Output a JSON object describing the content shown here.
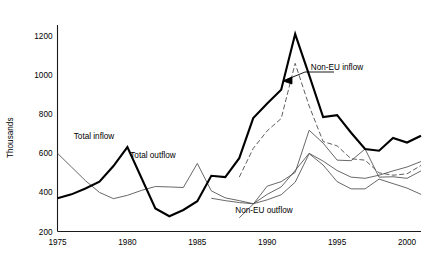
{
  "chart_data": {
    "type": "line",
    "title": "",
    "subtitle": "",
    "xlabel": "",
    "ylabel": "Thousands",
    "xlim": [
      1975,
      2001
    ],
    "ylim": [
      200,
      1200
    ],
    "ytick_labels": [
      "200",
      "400",
      "600",
      "800",
      "1000",
      "1200"
    ],
    "yticks": [
      200,
      400,
      600,
      800,
      1000,
      1200
    ],
    "xtick_labels": [
      "1975",
      "1980",
      "1985",
      "1990",
      "1995",
      "2000"
    ],
    "xticks": [
      1975,
      1980,
      1985,
      1990,
      1995,
      2000
    ],
    "grid": false,
    "legend": "inline-labels",
    "series": [
      {
        "name": "Total inflow",
        "style": "thick-solid",
        "x": [
          1975,
          1976,
          1977,
          1978,
          1979,
          1980,
          1981,
          1982,
          1983,
          1984,
          1985,
          1986,
          1987,
          1988,
          1989,
          1990,
          1991,
          1992,
          1993,
          1994,
          1995,
          1996,
          1997,
          1998,
          1999,
          2000,
          2001
        ],
        "values": [
          370,
          390,
          420,
          455,
          535,
          632,
          475,
          318,
          278,
          310,
          355,
          485,
          478,
          575,
          780,
          855,
          925,
          1210,
          1000,
          785,
          795,
          705,
          622,
          613,
          678,
          655,
          690
        ]
      },
      {
        "name": "Total outflow",
        "style": "thin-solid",
        "x": [
          1975,
          1976,
          1977,
          1978,
          1979,
          1980,
          1981,
          1982,
          1983,
          1984,
          1985,
          1986,
          1987,
          1988,
          1989,
          1990,
          1991,
          1992,
          1993,
          1994,
          1995,
          1996,
          1997,
          1998,
          1999,
          2000,
          2001
        ],
        "values": [
          600,
          530,
          460,
          400,
          368,
          385,
          410,
          430,
          428,
          425,
          548,
          408,
          372,
          358,
          342,
          390,
          428,
          512,
          600,
          560,
          512,
          478,
          472,
          488,
          510,
          530,
          558
        ]
      },
      {
        "name": "Non-EU inflow",
        "style": "dashed",
        "x": [
          1988,
          1989,
          1990,
          1991,
          1992,
          1993,
          1994,
          1995,
          1996,
          1997,
          1998,
          1999,
          2000,
          2001
        ],
        "values": [
          478,
          625,
          715,
          778,
          1060,
          842,
          660,
          638,
          572,
          565,
          500,
          488,
          495,
          538
        ]
      },
      {
        "name": "Non-EU outflow",
        "style": "thin-solid",
        "x": [
          1988,
          1989,
          1990,
          1991,
          1992,
          1993,
          1994,
          1995,
          1996,
          1997,
          1998,
          1999,
          2000,
          2001
        ],
        "values": [
          270,
          340,
          432,
          455,
          502,
          718,
          652,
          565,
          562,
          622,
          478,
          480,
          472,
          510
        ]
      },
      {
        "name": "Non-EU outflow lower",
        "style": "thin-solid",
        "x": [
          1986,
          1987,
          1988,
          1989,
          1990,
          1991,
          1992,
          1993,
          1994,
          1995,
          1996,
          1997,
          1998,
          1999,
          2000,
          2001
        ],
        "values": [
          370,
          358,
          348,
          342,
          362,
          388,
          452,
          598,
          540,
          455,
          418,
          418,
          468,
          445,
          422,
          390
        ]
      }
    ],
    "annotations": [
      {
        "text": "Total inflow",
        "x_px": 94,
        "y_px": 139
      },
      {
        "text": "Total outflow",
        "x_px": 153,
        "y_px": 158
      },
      {
        "text": "Non-EU inflow",
        "x_px": 337,
        "y_px": 70
      },
      {
        "text": "Non-EU outflow",
        "x_px": 264,
        "y_px": 213
      }
    ]
  },
  "axes": {
    "y_axis_title": "Thousands"
  },
  "colors": {
    "thick_line": "#000000",
    "thin_line": "#4d4d4d",
    "axis": "#1a1a1a",
    "background": "#ffffff"
  }
}
